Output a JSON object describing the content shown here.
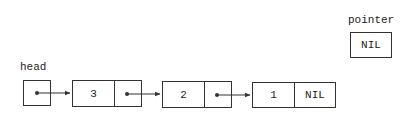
{
  "diagram": {
    "colors": {
      "background": "#ffffff",
      "stroke": "#333333",
      "text": "#222222"
    },
    "head": {
      "label": "head",
      "label_pos": {
        "x": 20,
        "y": 61
      },
      "box": {
        "x": 23,
        "y": 80,
        "w": 28,
        "h": 26
      },
      "value": "pointer-dot"
    },
    "pointer": {
      "label": "pointer",
      "label_pos": {
        "x": 348,
        "y": 14
      },
      "box": {
        "x": 350,
        "y": 32,
        "w": 42,
        "h": 26
      },
      "value": "NIL"
    },
    "nodes": [
      {
        "key": "3",
        "next": "pointer-dot",
        "x": 72,
        "y": 80,
        "w": 70,
        "h": 27,
        "divider": 42
      },
      {
        "key": "2",
        "next": "pointer-dot",
        "x": 162,
        "y": 81,
        "w": 70,
        "h": 27,
        "divider": 42
      },
      {
        "key": "1",
        "next": "NIL",
        "x": 252,
        "y": 82,
        "w": 84,
        "h": 26,
        "divider": 42
      }
    ],
    "arrows": [
      {
        "from": "head",
        "x1": 37,
        "y1": 93,
        "x2": 70,
        "y2": 93
      },
      {
        "from": "node-3",
        "x1": 127,
        "y1": 94,
        "x2": 160,
        "y2": 94
      },
      {
        "from": "node-2",
        "x1": 217,
        "y1": 95,
        "x2": 250,
        "y2": 95
      }
    ]
  }
}
